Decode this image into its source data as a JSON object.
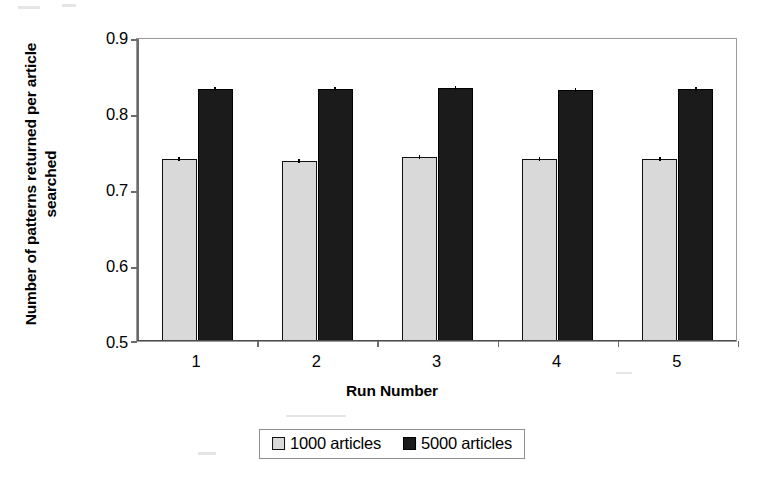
{
  "chart_data": {
    "type": "bar",
    "title": "",
    "subtitle": "",
    "xlabel": "Run Number",
    "ylabel": "Number of patterns returned per article searched",
    "categories": [
      "1",
      "2",
      "3",
      "4",
      "5"
    ],
    "ylim": [
      0.5,
      0.9
    ],
    "yticks": [
      0.5,
      0.6,
      0.7,
      0.8,
      0.9
    ],
    "ytick_labels": [
      "0.5",
      "0.6",
      "0.7",
      "0.8",
      "0.9"
    ],
    "grid": false,
    "legend_position": "bottom",
    "series": [
      {
        "name": "1000 articles",
        "color": "#d9d9d9",
        "values": [
          0.74,
          0.737,
          0.742,
          0.739,
          0.74
        ],
        "errors": [
          0.004,
          0.004,
          0.004,
          0.004,
          0.004
        ]
      },
      {
        "name": "5000 articles",
        "color": "#1b1b1b",
        "values": [
          0.832,
          0.832,
          0.833,
          0.83,
          0.832
        ],
        "errors": [
          0.002,
          0.002,
          0.002,
          0.002,
          0.002
        ]
      }
    ]
  },
  "axes": {
    "y_title": "Number of patterns returned per article searched",
    "x_title": "Run Number",
    "y_tick_labels": [
      "0.9",
      "0.8",
      "0.7",
      "0.6",
      "0.5"
    ],
    "x_tick_labels": [
      "1",
      "2",
      "3",
      "4",
      "5"
    ]
  },
  "legend": {
    "items": [
      {
        "label": "1000 articles",
        "swatch": "light-gray-square-icon"
      },
      {
        "label": "5000 articles",
        "swatch": "black-square-icon"
      }
    ]
  }
}
